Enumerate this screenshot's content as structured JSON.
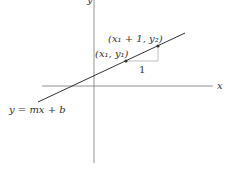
{
  "diagram": {
    "colors": {
      "axis": "#777777",
      "line": "#333333",
      "guide": "#999999",
      "point": "#333333",
      "text": "#333333"
    },
    "axes": {
      "x_label": "x",
      "y_label": "y"
    },
    "line_label": "y = mx + b",
    "points": [
      {
        "label": "(x₁, y₁)"
      },
      {
        "label": "(x₁ + 1, y₂)"
      }
    ],
    "run_label": "1"
  }
}
